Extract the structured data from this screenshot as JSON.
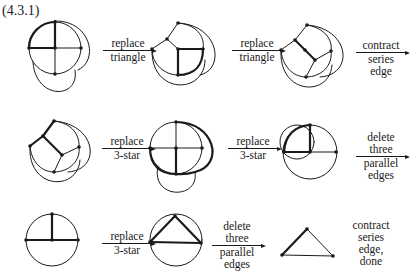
{
  "figure": {
    "title": "(4.3.1)"
  },
  "steps": [
    {
      "label_lines": [
        "replace",
        "triangle"
      ]
    },
    {
      "label_lines": [
        "replace",
        "triangle"
      ]
    },
    {
      "label_lines": [
        "contract",
        "series",
        "edge"
      ]
    },
    {
      "label_lines": [
        "replace",
        "3-star"
      ]
    },
    {
      "label_lines": [
        "replace",
        "3-star"
      ]
    },
    {
      "label_lines": [
        "delete",
        "three",
        "parallel",
        "edges"
      ]
    },
    {
      "label_lines": [
        "replace",
        "3-star"
      ]
    },
    {
      "label_lines": [
        "delete",
        "three",
        "parallel",
        "edges"
      ]
    },
    {
      "label_lines": [
        "contract",
        "series",
        "edge,",
        "done"
      ]
    }
  ],
  "colors": {
    "ink": "#1a1a1a",
    "background": "#ffffff"
  }
}
